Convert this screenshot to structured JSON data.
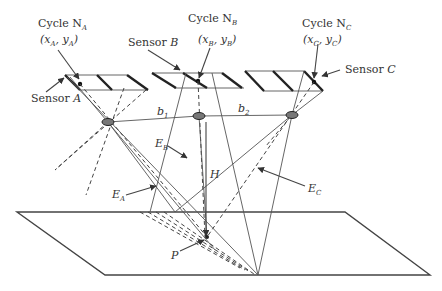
{
  "diagram": {
    "labels": {
      "cycle_a": {
        "main": "Cycle N",
        "sub": "A",
        "coord_prefix": "(x",
        "coord_sub1": "A",
        "coord_mid": ", y",
        "coord_sub2": "A",
        "coord_suffix": ")"
      },
      "cycle_b": {
        "main": "Cycle N",
        "sub": "B",
        "coord_prefix": "(x",
        "coord_sub1": "B",
        "coord_mid": ", y",
        "coord_sub2": "B",
        "coord_suffix": ")"
      },
      "cycle_c": {
        "main": "Cycle N",
        "sub": "C",
        "coord_prefix": "(x",
        "coord_sub1": "C",
        "coord_mid": ", y",
        "coord_sub2": "C",
        "coord_suffix": ")"
      },
      "sensor_a": {
        "main": "Sensor ",
        "letter": "A"
      },
      "sensor_b": {
        "main": "Sensor ",
        "letter": "B"
      },
      "sensor_c": {
        "main": "Sensor ",
        "letter": "C"
      },
      "baseline_1": {
        "main": "b",
        "sub": "1"
      },
      "baseline_2": {
        "main": "b",
        "sub": "2"
      },
      "ray_a": {
        "main": "E",
        "sub": "A"
      },
      "ray_b": {
        "main": "E",
        "sub": "B"
      },
      "ray_c": {
        "main": "E",
        "sub": "C"
      },
      "height": {
        "main": "H"
      },
      "ground_point": {
        "main": "P"
      }
    }
  }
}
